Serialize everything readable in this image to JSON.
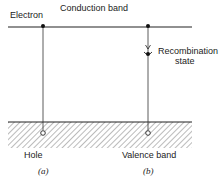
{
  "figure": {
    "labels": {
      "electron": "Electron",
      "conduction_band": "Conduction band",
      "recombination_state_line1": "Recombination",
      "recombination_state_line2": "state",
      "hole": "Hole",
      "valence_band": "Valence band"
    },
    "captions": {
      "a": "(a)",
      "b": "(b)"
    },
    "colors": {
      "line": "#222222",
      "hatch": "#555555",
      "background": "#ffffff"
    }
  }
}
